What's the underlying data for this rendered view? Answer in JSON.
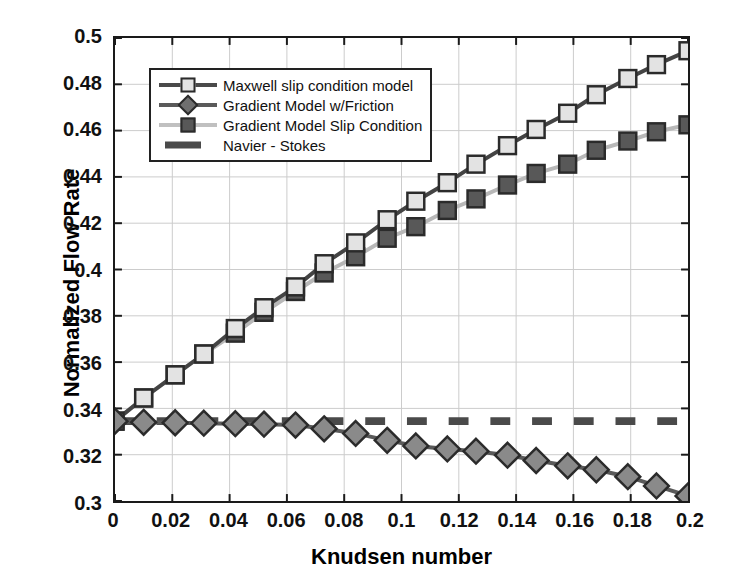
{
  "chart_data": {
    "type": "line",
    "title": "",
    "xlabel": "Knudsen number",
    "ylabel": "Normalized Flow Rate",
    "xlim": [
      0,
      0.2
    ],
    "ylim": [
      0.3,
      0.5
    ],
    "xticks": [
      "0",
      "0.02",
      "0.04",
      "0.06",
      "0.08",
      "0.1",
      "0.12",
      "0.14",
      "0.16",
      "0.18",
      "0.2"
    ],
    "xtick_values": [
      0,
      0.02,
      0.04,
      0.06,
      0.08,
      0.1,
      0.12,
      0.14,
      0.16,
      0.18,
      0.2
    ],
    "yticks": [
      "0.3",
      "0.32",
      "0.34",
      "0.36",
      "0.38",
      "0.4",
      "0.42",
      "0.44",
      "0.46",
      "0.48",
      "0.5"
    ],
    "ytick_values": [
      0.3,
      0.32,
      0.34,
      0.36,
      0.38,
      0.4,
      0.42,
      0.44,
      0.46,
      0.48,
      0.5
    ],
    "grid": true,
    "legend_position": "upper-left-inside",
    "x": [
      0,
      0.01,
      0.021,
      0.031,
      0.042,
      0.052,
      0.063,
      0.073,
      0.084,
      0.095,
      0.105,
      0.116,
      0.126,
      0.137,
      0.147,
      0.158,
      0.168,
      0.179,
      0.189,
      0.2
    ],
    "series": [
      {
        "name": "Maxwell slip condition model",
        "marker": "square",
        "marker_fill": "#e3e3e3",
        "line_color": "#444444",
        "values": [
          0.3345,
          0.3445,
          0.3545,
          0.3635,
          0.3745,
          0.3835,
          0.3925,
          0.4025,
          0.4115,
          0.4215,
          0.4295,
          0.4375,
          0.4455,
          0.4535,
          0.4605,
          0.4675,
          0.4755,
          0.4825,
          0.4885,
          0.4945
        ]
      },
      {
        "name": "Gradient Model w/Friction",
        "marker": "diamond",
        "marker_fill": "#8a8a8a",
        "line_color": "#5a5a5a",
        "values": [
          0.3345,
          0.334,
          0.3338,
          0.3336,
          0.3334,
          0.3332,
          0.3328,
          0.3312,
          0.3292,
          0.3262,
          0.3238,
          0.3225,
          0.3215,
          0.3198,
          0.3175,
          0.3152,
          0.3135,
          0.3105,
          0.3065,
          0.3022
        ]
      },
      {
        "name": "Gradient Model Slip Condition",
        "marker": "square",
        "marker_fill": "#585858",
        "line_color": "#b8b8b8",
        "values": [
          0.3345,
          0.3445,
          0.3545,
          0.3635,
          0.3725,
          0.3815,
          0.3905,
          0.3985,
          0.4055,
          0.4135,
          0.4185,
          0.4255,
          0.4305,
          0.4365,
          0.4415,
          0.4455,
          0.4515,
          0.4555,
          0.4595,
          0.4625
        ]
      },
      {
        "name": "Navier - Stokes",
        "marker": "none",
        "line_style": "dashed",
        "line_color": "#4a4a4a",
        "constant_value": 0.3345,
        "values": [
          0.3345,
          0.3345,
          0.3345,
          0.3345,
          0.3345,
          0.3345,
          0.3345,
          0.3345,
          0.3345,
          0.3345,
          0.3345,
          0.3345,
          0.3345,
          0.3345,
          0.3345,
          0.3345,
          0.3345,
          0.3345,
          0.3345,
          0.3345
        ]
      }
    ]
  },
  "legend": {
    "items": [
      {
        "label": "Maxwell slip condition model"
      },
      {
        "label": "Gradient Model w/Friction"
      },
      {
        "label": "Gradient Model Slip Condition"
      },
      {
        "label": "Navier - Stokes"
      }
    ]
  },
  "colors": {
    "axis": "#1a1a1a",
    "grid": "#cccccc",
    "background": "#ffffff"
  }
}
